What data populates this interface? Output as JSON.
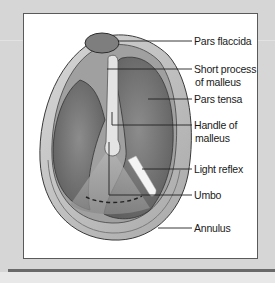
{
  "figure": {
    "labels": [
      {
        "id": "pars-flaccida",
        "text": "Pars flaccida"
      },
      {
        "id": "short-process",
        "line1": "Short process",
        "line2": "of malleus"
      },
      {
        "id": "pars-tensa",
        "text": "Pars tensa"
      },
      {
        "id": "handle-of-malleus",
        "line1": "Handle of",
        "line2": "malleus"
      },
      {
        "id": "light-reflex",
        "text": "Light reflex"
      },
      {
        "id": "umbo",
        "text": "Umbo"
      },
      {
        "id": "annulus",
        "text": "Annulus"
      }
    ]
  },
  "colors": {
    "background": "#d6d6d6",
    "panel": "#ffffff",
    "membrane_dark": "#6e6e6e",
    "membrane_mid": "#9a9a9a",
    "rim": "#c4c4c4",
    "outline": "#3a3a3a",
    "leader": "#222222"
  }
}
